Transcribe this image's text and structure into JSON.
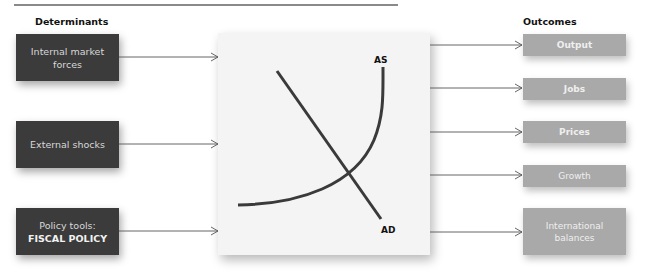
{
  "headings": {
    "left": "Determinants",
    "right": "Outcomes"
  },
  "determinants": [
    {
      "line1": "Internal market",
      "line2": "forces"
    },
    {
      "line1": "External shocks"
    },
    {
      "line1": "Policy tools:",
      "line2": "FISCAL POLICY"
    }
  ],
  "chart": {
    "curves": [
      {
        "label": "AS",
        "shape": "upward-sloping convex curve"
      },
      {
        "label": "AD",
        "shape": "downward-sloping line"
      }
    ]
  },
  "outcomes": [
    {
      "label": "Output"
    },
    {
      "label": "Jobs"
    },
    {
      "label": "Prices"
    },
    {
      "label": "Growth"
    },
    {
      "line1": "International",
      "line2": "balances"
    }
  ],
  "colors": {
    "determinant_box": "#3b3b3b",
    "outcome_box": "#a9a9a9",
    "panel": "#f4f4f4",
    "curve": "#3a3a3a",
    "connector": "#555555"
  }
}
